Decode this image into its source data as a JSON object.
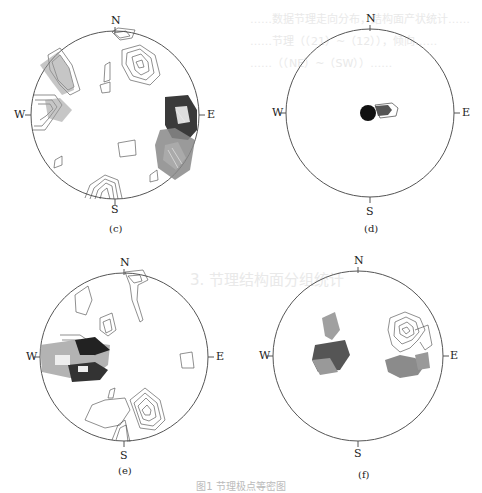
{
  "figure": {
    "caption": "图1  节理极点等密图",
    "panels": [
      {
        "id": "c",
        "label": "(c)",
        "cx": 115,
        "cy": 115,
        "r": 84,
        "dirs": {
          "N": "N",
          "E": "E",
          "S": "S",
          "W": "W"
        }
      },
      {
        "id": "d",
        "label": "(d)",
        "cx": 370,
        "cy": 113,
        "r": 84,
        "dirs": {
          "N": "N",
          "E": "E",
          "S": "S",
          "W": "W"
        }
      },
      {
        "id": "e",
        "label": "(e)",
        "cx": 124,
        "cy": 357,
        "r": 84,
        "dirs": {
          "N": "N",
          "E": "E",
          "S": "S",
          "W": "W"
        }
      },
      {
        "id": "f",
        "label": "(f)",
        "cx": 358,
        "cy": 356,
        "r": 85,
        "dirs": {
          "N": "N",
          "E": "E",
          "S": "S",
          "W": "W"
        }
      }
    ]
  },
  "background_text": {
    "lines": [
      "……数据节理走向分布，结构面产状统计……",
      "……节理（（21）~（12）），倾向……",
      "……（（NE）~（SW））……",
      "3.  节理结构面分组统计"
    ]
  }
}
